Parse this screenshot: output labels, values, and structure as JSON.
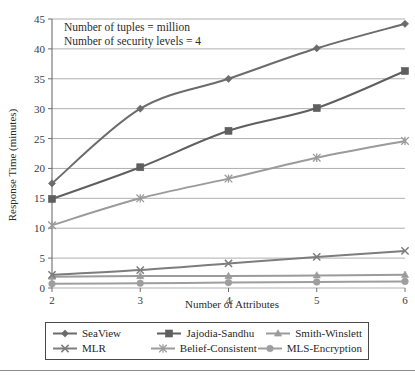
{
  "chart_data": {
    "type": "line",
    "title": "",
    "xlabel": "Number of Attributes",
    "ylabel": "Response Time (minutes)",
    "x": [
      2,
      3,
      4,
      5,
      6
    ],
    "xtick_labels": [
      "2",
      "3",
      "4",
      "5",
      "6"
    ],
    "ytick_labels": [
      "0",
      "5",
      "10",
      "15",
      "20",
      "25",
      "30",
      "35",
      "40",
      "45"
    ],
    "yticks": [
      0,
      5,
      10,
      15,
      20,
      25,
      30,
      35,
      40,
      45
    ],
    "xlim": [
      2,
      6
    ],
    "ylim": [
      0,
      45
    ],
    "grid": "horizontal",
    "legend_position": "below-axes",
    "annotations": [
      "Number of tuples = million",
      "Number of security levels = 4"
    ],
    "series": [
      {
        "name": "SeaView",
        "marker": "diamond",
        "color": "#6b6b6b",
        "values": [
          17.5,
          30.0,
          35.0,
          40.1,
          44.2
        ]
      },
      {
        "name": "Jajodia-Sandhu",
        "marker": "square",
        "color": "#5f5f5f",
        "values": [
          14.9,
          20.2,
          26.3,
          30.1,
          36.3
        ]
      },
      {
        "name": "Smith-Winslett",
        "marker": "triangle",
        "color": "#9b9b9b",
        "values": [
          1.9,
          2.0,
          2.0,
          2.1,
          2.2
        ]
      },
      {
        "name": "MLR",
        "marker": "x",
        "color": "#7d7d7d",
        "values": [
          2.2,
          3.0,
          4.1,
          5.2,
          6.2
        ]
      },
      {
        "name": "Belief-Consistent",
        "marker": "asterisk",
        "color": "#9b9b9b",
        "values": [
          10.5,
          15.0,
          18.3,
          21.8,
          24.6
        ]
      },
      {
        "name": "MLS-Encryption",
        "marker": "circle",
        "color": "#9e9e9e",
        "values": [
          0.7,
          0.8,
          0.9,
          1.0,
          1.1
        ]
      }
    ]
  },
  "legend": {
    "rows": [
      [
        {
          "label": "SeaView",
          "marker": "diamond",
          "color": "#6b6b6b"
        },
        {
          "label": "Jajodia-Sandhu",
          "marker": "square",
          "color": "#5f5f5f"
        },
        {
          "label": "Smith-Winslett",
          "marker": "triangle",
          "color": "#9b9b9b"
        }
      ],
      [
        {
          "label": "MLR",
          "marker": "x",
          "color": "#7d7d7d"
        },
        {
          "label": "Belief-Consistent",
          "marker": "asterisk",
          "color": "#9b9b9b"
        },
        {
          "label": "MLS-Encryption",
          "marker": "circle",
          "color": "#9e9e9e"
        }
      ]
    ]
  }
}
